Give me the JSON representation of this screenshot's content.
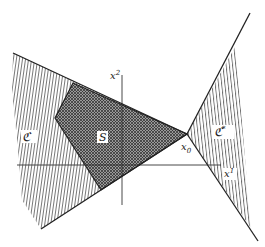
{
  "figure": {
    "type": "cone-separation-diagram",
    "colors": {
      "background": "#ffffff",
      "line": "#222222",
      "hatch": "#555555",
      "crosshatch": "#333333"
    }
  },
  "axes": {
    "x1_label": "x",
    "x1_sup": "1",
    "x2_label": "x",
    "x2_sup": "2"
  },
  "regions": {
    "cone_K": {
      "label": "ℭ",
      "fill": "vertical-hatch"
    },
    "set_S": {
      "label": "S",
      "fill": "cross-hatch"
    },
    "dual_cone_K_star": {
      "label": "ℭ",
      "sup": "*",
      "fill": "vertical-hatch"
    }
  },
  "point": {
    "label": "x",
    "sub": "0"
  }
}
